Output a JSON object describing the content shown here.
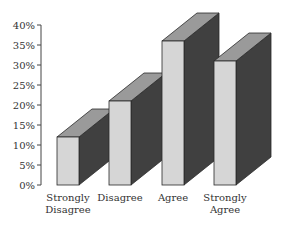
{
  "chart_data": {
    "type": "bar",
    "style": "3d",
    "title": "",
    "xlabel": "",
    "ylabel": "",
    "categories": [
      "Strongly Disagree",
      "Disagree",
      "Agree",
      "Strongly Agree"
    ],
    "category_lines": [
      [
        "Strongly",
        "Disagree"
      ],
      [
        "Disagree"
      ],
      [
        "Agree"
      ],
      [
        "Strongly",
        "Agree"
      ]
    ],
    "values": [
      12,
      21,
      36,
      31
    ],
    "ylim": [
      0,
      40
    ],
    "yticks": [
      "0%",
      "5%",
      "10%",
      "15%",
      "20%",
      "25%",
      "30%",
      "35%",
      "40%"
    ],
    "grid": false,
    "legend": null
  },
  "colors": {
    "front": "#d6d6d6",
    "top": "#9a9a9a",
    "side": "#404040",
    "outline": "#2a2a2a",
    "axis": "#444444"
  }
}
